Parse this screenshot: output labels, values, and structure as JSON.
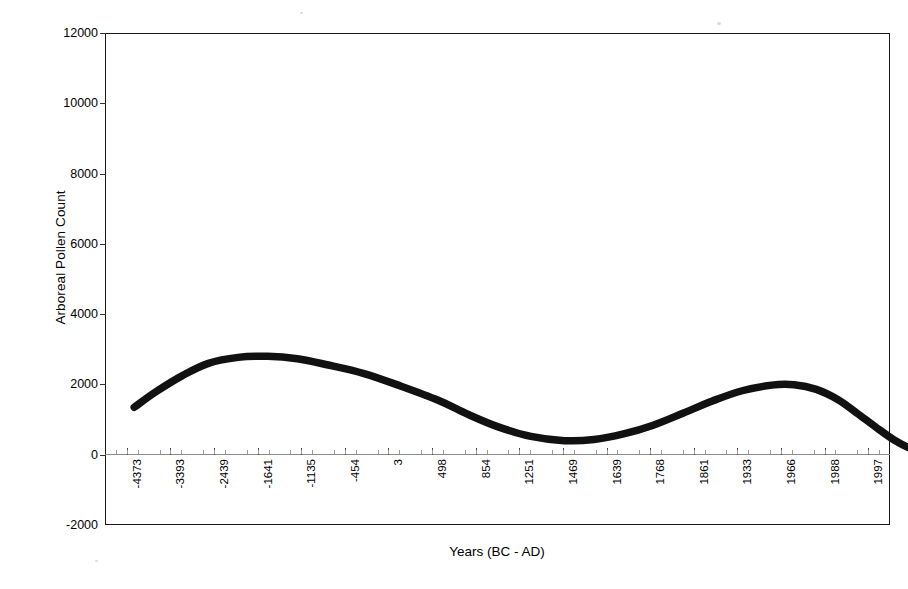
{
  "chart_data": {
    "type": "line",
    "title": "",
    "xlabel": "Years (BC - AD)",
    "ylabel": "Arboreal Pollen Count",
    "ylim": [
      -2000,
      12000
    ],
    "ytick_values": [
      12000,
      10000,
      8000,
      6000,
      4000,
      2000,
      0,
      -2000
    ],
    "ytick_labels": [
      "12000",
      "10000",
      "8000",
      "6000",
      "4000",
      "2000",
      "0",
      "-2000"
    ],
    "grid": false,
    "legend": null,
    "categories": [
      "-4373",
      "-3393",
      "-2439",
      "-1641",
      "-1135",
      "-454",
      "3",
      "498",
      "854",
      "1251",
      "1469",
      "1639",
      "1768",
      "1861",
      "1933",
      "1966",
      "1988",
      "1997"
    ],
    "series": [
      {
        "name": "Arboreal Pollen Count",
        "color": "#111111",
        "linewidth": 7,
        "values": [
          1350,
          2620,
          2790,
          2500,
          2100,
          1500,
          900,
          480,
          400,
          700,
          1200,
          1750,
          1990,
          1800,
          1150,
          620,
          60,
          400
        ]
      }
    ],
    "curve_points": [
      [
        0.01,
        1350
      ],
      [
        0.04,
        1800
      ],
      [
        0.075,
        2250
      ],
      [
        0.11,
        2600
      ],
      [
        0.15,
        2770
      ],
      [
        0.19,
        2800
      ],
      [
        0.23,
        2730
      ],
      [
        0.27,
        2560
      ],
      [
        0.32,
        2310
      ],
      [
        0.37,
        1950
      ],
      [
        0.42,
        1550
      ],
      [
        0.46,
        1150
      ],
      [
        0.5,
        800
      ],
      [
        0.545,
        520
      ],
      [
        0.59,
        400
      ],
      [
        0.63,
        430
      ],
      [
        0.67,
        590
      ],
      [
        0.71,
        840
      ],
      [
        0.75,
        1180
      ],
      [
        0.79,
        1530
      ],
      [
        0.83,
        1820
      ],
      [
        0.87,
        1980
      ],
      [
        0.9,
        1990
      ],
      [
        0.93,
        1860
      ],
      [
        0.96,
        1560
      ],
      [
        0.985,
        1180
      ],
      [
        1.01,
        790
      ],
      [
        1.035,
        420
      ],
      [
        1.06,
        150
      ],
      [
        1.08,
        30
      ],
      [
        1.095,
        50
      ],
      [
        1.11,
        180
      ],
      [
        1.12,
        400
      ]
    ]
  },
  "axes": {
    "x_axis_title": "Years (BC - AD)",
    "y_axis_title": "Arboreal Pollen Count"
  }
}
